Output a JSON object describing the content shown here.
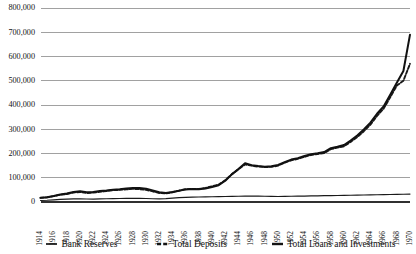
{
  "chart_data": {
    "type": "line",
    "title": "",
    "subtitle": "",
    "xlabel": "",
    "ylabel": "",
    "grid": true,
    "legend_position": "bottom",
    "xlim": [
      1914,
      1970
    ],
    "ylim": [
      0,
      800000
    ],
    "y_ticks": [
      0,
      100000,
      200000,
      300000,
      400000,
      500000,
      600000,
      700000,
      800000
    ],
    "y_tick_labels": [
      "0",
      "100,000",
      "200,000",
      "300,000",
      "400,000",
      "500,000",
      "600,000",
      "700,000",
      "800,000"
    ],
    "x_ticks": [
      1914,
      1916,
      1918,
      1920,
      1922,
      1924,
      1926,
      1928,
      1930,
      1932,
      1934,
      1936,
      1938,
      1940,
      1942,
      1944,
      1946,
      1948,
      1950,
      1952,
      1954,
      1956,
      1958,
      1960,
      1962,
      1964,
      1966,
      1968,
      1970
    ],
    "x_tick_labels": [
      "1914",
      "1916",
      "1918",
      "1920",
      "1922",
      "1924",
      "1926",
      "1928",
      "1930",
      "1932",
      "1934",
      "1936",
      "1938",
      "1940",
      "1942",
      "1944",
      "1946",
      "1948",
      "1950",
      "1952",
      "1954",
      "1956",
      "1958",
      "1960",
      "1962",
      "1964",
      "1966",
      "1968",
      "1970"
    ],
    "x": [
      1914,
      1915,
      1916,
      1917,
      1918,
      1919,
      1920,
      1921,
      1922,
      1923,
      1924,
      1925,
      1926,
      1927,
      1928,
      1929,
      1930,
      1931,
      1932,
      1933,
      1934,
      1935,
      1936,
      1937,
      1938,
      1939,
      1940,
      1941,
      1942,
      1943,
      1944,
      1945,
      1946,
      1947,
      1948,
      1949,
      1950,
      1951,
      1952,
      1953,
      1954,
      1955,
      1956,
      1957,
      1958,
      1959,
      1960,
      1961,
      1962,
      1963,
      1964,
      1965,
      1966,
      1967,
      1968,
      1969,
      1970
    ],
    "series": [
      {
        "name": "Bank Reserves",
        "style": "solid-thin",
        "color": "#1a1a1a",
        "values": [
          6000,
          7000,
          9000,
          11000,
          12000,
          13000,
          13500,
          12500,
          12000,
          13000,
          13500,
          14000,
          14500,
          15000,
          15500,
          15000,
          14500,
          13500,
          13000,
          14000,
          16000,
          18000,
          19000,
          20000,
          20500,
          21000,
          21500,
          22000,
          22500,
          23000,
          23500,
          24000,
          24500,
          24000,
          23500,
          23000,
          22500,
          23000,
          23500,
          24000,
          24500,
          25000,
          25500,
          26000,
          26500,
          27000,
          27500,
          28000,
          28500,
          29000,
          29500,
          30000,
          30500,
          31000,
          31500,
          32000,
          32500
        ]
      },
      {
        "name": "Total Deposits",
        "style": "dashed",
        "color": "#1a1a1a",
        "values": [
          17000,
          19000,
          24000,
          30000,
          33000,
          39000,
          41000,
          37000,
          39000,
          42000,
          45000,
          49000,
          50000,
          52000,
          54000,
          53000,
          50000,
          44000,
          37000,
          35000,
          40000,
          47000,
          53000,
          54000,
          54000,
          58000,
          65000,
          72000,
          90000,
          115000,
          135000,
          155000,
          150000,
          146000,
          144000,
          145000,
          150000,
          162000,
          172000,
          178000,
          186000,
          194000,
          198000,
          202000,
          218000,
          224000,
          230000,
          248000,
          268000,
          292000,
          319000,
          355000,
          385000,
          432000,
          480000,
          500000,
          570000
        ]
      },
      {
        "name": "Total Loans and Investments",
        "style": "solid-thick",
        "color": "#111111",
        "values": [
          18000,
          20000,
          25000,
          31000,
          35000,
          41000,
          44000,
          40000,
          41000,
          45000,
          47000,
          51000,
          53000,
          56000,
          58000,
          58000,
          55000,
          48000,
          40000,
          37000,
          41000,
          46000,
          52000,
          54000,
          53000,
          56000,
          62000,
          69000,
          88000,
          114000,
          136000,
          160000,
          152000,
          148000,
          145000,
          147000,
          153000,
          164000,
          175000,
          181000,
          190000,
          197000,
          201000,
          206000,
          222000,
          228000,
          235000,
          253000,
          274000,
          299000,
          327000,
          364000,
          394000,
          442000,
          492000,
          540000,
          690000
        ]
      }
    ],
    "legend": [
      {
        "label": "Bank Reserves",
        "style": "solid-thin"
      },
      {
        "label": "Total Deposits",
        "style": "dashed"
      },
      {
        "label": "Total Loans and Investments",
        "style": "solid-thick"
      }
    ]
  }
}
